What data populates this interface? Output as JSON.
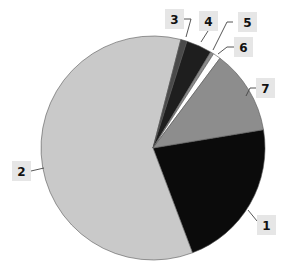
{
  "chart_data": {
    "type": "pie",
    "title": "",
    "start_angle_deg": 80.6,
    "direction": "clockwise",
    "categories": [
      "1",
      "2",
      "3",
      "4",
      "5",
      "6",
      "7"
    ],
    "values": [
      21.9,
      59.8,
      0.9,
      3.7,
      0.5,
      1.1,
      12.2
    ],
    "unit": "percent (estimated from slice angles)",
    "colors": [
      "#0b0b0b",
      "#c9c9c9",
      "#4a4a4a",
      "#1e1e1e",
      "#8a8a8a",
      "#ffffff",
      "#8d8d8d"
    ],
    "legend": "none (labels with leader lines)",
    "labels": [
      {
        "text": "1",
        "box": [
          257,
          215
        ],
        "leader": [
          [
            248,
            210
          ],
          [
            257,
            221
          ]
        ]
      },
      {
        "text": "2",
        "box": [
          12,
          161
        ],
        "leader": [
          [
            44,
            168
          ],
          [
            31,
            171
          ]
        ]
      },
      {
        "text": "3",
        "box": [
          165,
          9
        ],
        "leader": [
          [
            184,
            19
          ],
          [
            191,
            19
          ],
          [
            186,
            37
          ]
        ]
      },
      {
        "text": "4",
        "box": [
          199,
          11
        ],
        "leader": [
          [
            208,
            31
          ],
          [
            201,
            42
          ]
        ]
      },
      {
        "text": "5",
        "box": [
          238,
          12
        ],
        "leader": [
          [
            233,
            22
          ],
          [
            227,
            22
          ],
          [
            213,
            50
          ]
        ]
      },
      {
        "text": "6",
        "box": [
          234,
          37
        ],
        "leader": [
          [
            234,
            47
          ],
          [
            227,
            47
          ],
          [
            218,
            54
          ]
        ]
      },
      {
        "text": "7",
        "box": [
          256,
          78
        ],
        "leader": [
          [
            256,
            88
          ],
          [
            250,
            88
          ],
          [
            246,
            96
          ]
        ]
      }
    ]
  },
  "geometry": {
    "cx": 153,
    "cy": 148,
    "r": 112
  }
}
